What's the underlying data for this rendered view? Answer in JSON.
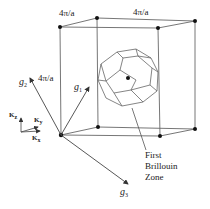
{
  "diagram": {
    "labels": {
      "edge_top_left": "4π/a",
      "edge_top_right": "4π/a",
      "edge_vertical": "4π/a",
      "g1": "g",
      "g1_sub": "1",
      "g2": "g",
      "g2_sub": "2",
      "g3": "g",
      "g3_sub": "3",
      "kz": "K",
      "kz_sub": "z",
      "ky": "K",
      "ky_sub": "y",
      "kx": "K",
      "kx_sub": "x",
      "bz_line1": "First",
      "bz_line2": "Brillouin",
      "bz_line3": "Zone"
    },
    "colors": {
      "line": "#555555",
      "dot": "#111111",
      "text": "#222222"
    }
  }
}
